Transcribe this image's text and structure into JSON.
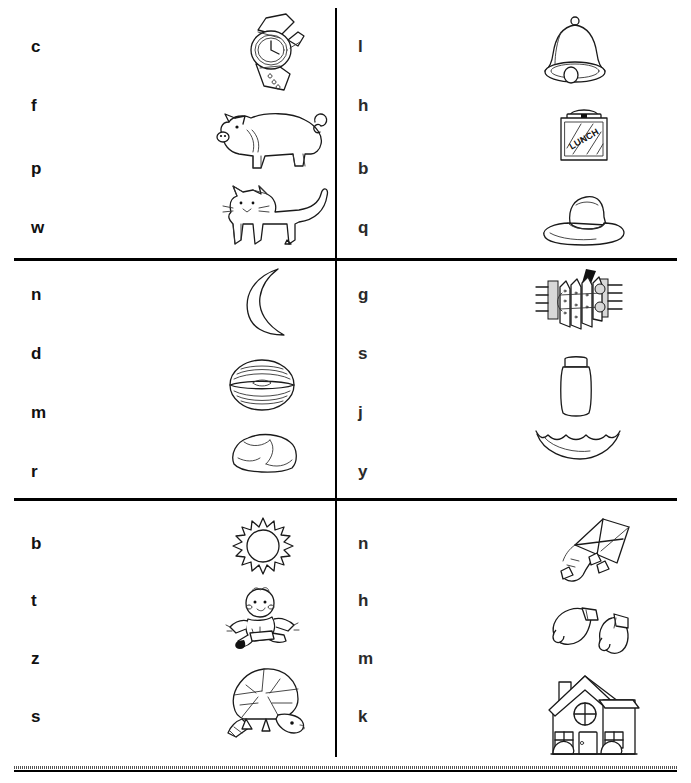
{
  "worksheet": {
    "title": "Beginning Sounds Letter-Picture Matching Worksheet",
    "columns": 2,
    "sections": 3,
    "ink_color": "#1a1a1a",
    "page_color": "#ffffff"
  },
  "sections": [
    {
      "id": "section-1",
      "left": {
        "letters": [
          "c",
          "f",
          "p",
          "w"
        ],
        "pictures": [
          {
            "name": "watch-picture",
            "label": "watch"
          },
          {
            "name": "pig-picture",
            "label": "pig"
          },
          {
            "name": "cat-picture",
            "label": "cat"
          }
        ]
      },
      "right": {
        "letters": [
          "l",
          "h",
          "b",
          "q"
        ],
        "pictures": [
          {
            "name": "bell-picture",
            "label": "bell"
          },
          {
            "name": "lunchbox-picture",
            "label": "lunchbox",
            "text": "LUNCH"
          },
          {
            "name": "hat-picture",
            "label": "hat"
          }
        ]
      }
    },
    {
      "id": "section-2",
      "left": {
        "letters": [
          "n",
          "d",
          "m",
          "r"
        ],
        "pictures": [
          {
            "name": "moon-picture",
            "label": "moon"
          },
          {
            "name": "nut-picture",
            "label": "nut"
          },
          {
            "name": "rock-picture",
            "label": "rock"
          }
        ]
      },
      "right": {
        "letters": [
          "g",
          "s",
          "j",
          "y"
        ],
        "pictures": [
          {
            "name": "gate-picture",
            "label": "gate"
          },
          {
            "name": "jar-picture",
            "label": "jar"
          },
          {
            "name": "smile-picture",
            "label": "smile"
          }
        ]
      }
    },
    {
      "id": "section-3",
      "left": {
        "letters": [
          "b",
          "t",
          "z",
          "s"
        ],
        "pictures": [
          {
            "name": "sun-picture",
            "label": "sun"
          },
          {
            "name": "baby-picture",
            "label": "baby"
          },
          {
            "name": "turtle-picture",
            "label": "turtle"
          }
        ]
      },
      "right": {
        "letters": [
          "n",
          "h",
          "m",
          "k"
        ],
        "pictures": [
          {
            "name": "kite-picture",
            "label": "kite"
          },
          {
            "name": "mittens-picture",
            "label": "mittens"
          },
          {
            "name": "house-picture",
            "label": "house"
          }
        ]
      }
    }
  ]
}
